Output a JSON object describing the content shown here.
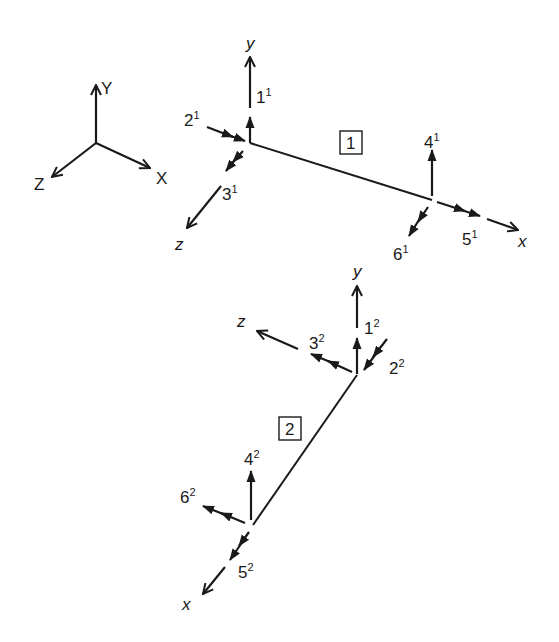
{
  "diagram": {
    "type": "frame-element-dof",
    "global_axes": {
      "x_label": "X",
      "y_label": "Y",
      "z_label": "Z"
    },
    "elements": [
      {
        "id": "1",
        "box_label": "1",
        "local_axes": {
          "x": "x",
          "y": "y",
          "z": "z"
        },
        "dofs": [
          {
            "num": "1",
            "sup": "1"
          },
          {
            "num": "2",
            "sup": "1"
          },
          {
            "num": "3",
            "sup": "1"
          },
          {
            "num": "4",
            "sup": "1"
          },
          {
            "num": "5",
            "sup": "1"
          },
          {
            "num": "6",
            "sup": "1"
          }
        ]
      },
      {
        "id": "2",
        "box_label": "2",
        "local_axes": {
          "x": "x",
          "y": "y",
          "z": "z"
        },
        "dofs": [
          {
            "num": "1",
            "sup": "2"
          },
          {
            "num": "2",
            "sup": "2"
          },
          {
            "num": "3",
            "sup": "2"
          },
          {
            "num": "4",
            "sup": "2"
          },
          {
            "num": "5",
            "sup": "2"
          },
          {
            "num": "6",
            "sup": "2"
          }
        ]
      }
    ],
    "colors": {
      "ink": "#1a1a1a",
      "background": "#ffffff"
    }
  }
}
